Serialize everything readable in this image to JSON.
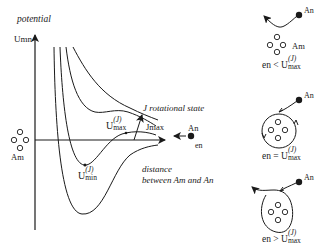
{
  "diagram": {
    "axis": {
      "y_label_top": "potential",
      "y_symbol": "Umn",
      "x_label_line1": "distance",
      "x_label_line2": "between Am and An"
    },
    "labels": {
      "rotational_state": "J rotational state",
      "j_max": "Jmax",
      "u_max_base": "U",
      "u_max_sup": "(J)",
      "u_max_sub": "max",
      "u_min_base": "U",
      "u_min_sup": "(J)",
      "u_min_sub": "min",
      "target_molecule": "Am",
      "incoming_particle": "An",
      "energy": "en"
    },
    "cases": [
      {
        "relation": "<",
        "left": "en",
        "right_base": "U",
        "right_sup": "(J)",
        "right_sub": "max",
        "particle": "An",
        "cluster": "Am",
        "outcome": "reflected"
      },
      {
        "relation": "=",
        "left": "en",
        "right_base": "U",
        "right_sup": "(J)",
        "right_sub": "max",
        "particle": "An",
        "outcome": "orbiting"
      },
      {
        "relation": ">",
        "left": "en",
        "right_base": "U",
        "right_sup": "(J)",
        "right_sub": "max",
        "particle": "An",
        "outcome": "captured-passes-through"
      }
    ],
    "colors": {
      "line": "#1a1a1a",
      "background": "#ffffff"
    }
  }
}
